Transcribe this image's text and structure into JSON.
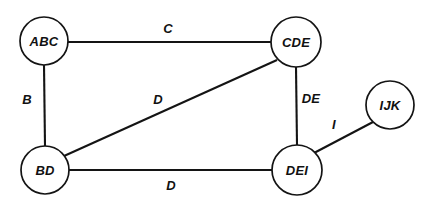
{
  "diagram": {
    "type": "undirected-graph",
    "background_color": "#ffffff",
    "stroke_color": "#141414",
    "text_color": "#111111",
    "width": 428,
    "height": 210,
    "nodes": [
      {
        "id": "ABC",
        "label": "ABC",
        "cx": 44,
        "cy": 41,
        "r": 24
      },
      {
        "id": "CDE",
        "label": "CDE",
        "cx": 296,
        "cy": 42,
        "r": 25
      },
      {
        "id": "IJK",
        "label": "IJK",
        "cx": 390,
        "cy": 105,
        "r": 24
      },
      {
        "id": "BD",
        "label": "BD",
        "cx": 45,
        "cy": 170,
        "r": 24
      },
      {
        "id": "DEI",
        "label": "DEI",
        "cx": 297,
        "cy": 170,
        "r": 25
      }
    ],
    "edges": [
      {
        "id": "abc-cde",
        "from": "ABC",
        "to": "CDE",
        "label": "C",
        "x1": 68,
        "y1": 42,
        "x2": 271,
        "y2": 42,
        "label_x": 168,
        "label_y": 28
      },
      {
        "id": "abc-bd",
        "from": "ABC",
        "to": "BD",
        "label": "B",
        "x1": 44,
        "y1": 65,
        "x2": 45,
        "y2": 146,
        "label_x": 27,
        "label_y": 99
      },
      {
        "id": "bd-cde",
        "from": "BD",
        "to": "CDE",
        "label": "D",
        "x1": 64,
        "y1": 156,
        "x2": 277,
        "y2": 60,
        "label_x": 158,
        "label_y": 99
      },
      {
        "id": "cde-dei",
        "from": "CDE",
        "to": "DEI",
        "label": "DE",
        "x1": 296,
        "y1": 67,
        "x2": 297,
        "y2": 145,
        "label_x": 311,
        "label_y": 98
      },
      {
        "id": "bd-dei",
        "from": "BD",
        "to": "DEI",
        "label": "D",
        "x1": 69,
        "y1": 170,
        "x2": 272,
        "y2": 170,
        "label_x": 171,
        "label_y": 185
      },
      {
        "id": "dei-ijk",
        "from": "DEI",
        "to": "IJK",
        "label": "I",
        "x1": 314,
        "y1": 153,
        "x2": 373,
        "y2": 122,
        "label_x": 334,
        "label_y": 124
      }
    ]
  }
}
